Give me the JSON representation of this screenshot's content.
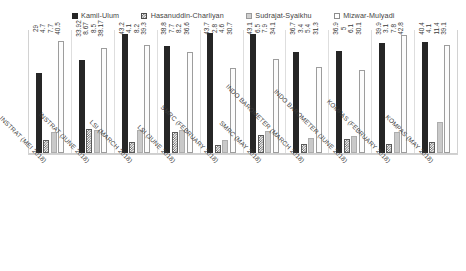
{
  "chart_data": {
    "type": "bar",
    "title": "",
    "xlabel": "",
    "ylabel": "",
    "ylim": [
      0,
      45
    ],
    "grid": false,
    "legend_position": "top-center",
    "categories": [
      "INSTRAT (MEI 2018)",
      "INSTRAT (JUNE 2018)",
      "LSI (MARCH 2018)",
      "LSI (JUNE 2018)",
      "SMRC (FEBRUARY 2018)",
      "SMRC (MAY 2018)",
      "INDO BAROMETER (MARCH 2018)",
      "INDO BAROMETER (JUNE 2018)",
      "KOMPAS (FEBRUARY 2018)",
      "KOMPAS (MAY 2018)"
    ],
    "series": [
      {
        "name": "Kamil-Ulum",
        "color": "#262626",
        "values": [
          29,
          33.92,
          43.2,
          38.8,
          43.7,
          43.1,
          36.7,
          36.9,
          39.9,
          40.4
        ],
        "labels": [
          "29",
          "33.92",
          "43.2",
          "38.8",
          "43.7",
          "43.1",
          "36.7",
          "36.9",
          "39.9",
          "40.4"
        ]
      },
      {
        "name": "Hasanuddin-Charliyan",
        "color": "#555555",
        "values": [
          4.7,
          8.67,
          4.1,
          7.7,
          2.8,
          6.5,
          3.4,
          5,
          3.1,
          4.1
        ],
        "labels": [
          "4.7",
          "8.67",
          "4.1",
          "7.7",
          "2.8",
          "6.5",
          "3.4",
          "5",
          "3.1",
          "4.1"
        ]
      },
      {
        "name": "Sudrajat-Syaikhu",
        "color": "#c9c9c9",
        "values": [
          7.7,
          8.5,
          8.2,
          8.2,
          4.6,
          7.9,
          5.4,
          6.1,
          7.8,
          11.4
        ],
        "labels": [
          "7.7",
          "8.5",
          "8.2",
          "8.2",
          "4.6",
          "7.9",
          "5.4",
          "6.1",
          "7.8",
          "11.4"
        ]
      },
      {
        "name": "Mizwar-Mulyadi",
        "color": "#fcfcfc",
        "values": [
          40.5,
          38.17,
          39.3,
          36.6,
          30.7,
          34.1,
          31.3,
          30.1,
          42.8,
          39.1
        ],
        "labels": [
          "40.5",
          "38.17",
          "39.3",
          "36.6",
          "30.7",
          "34.1",
          "31.3",
          "30.1",
          "42.8",
          "39.1"
        ]
      }
    ]
  }
}
